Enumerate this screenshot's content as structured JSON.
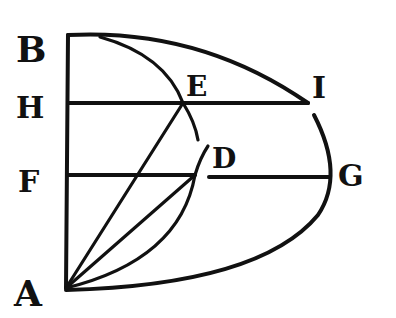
{
  "figure": {
    "type": "geometric-diagram",
    "background": "#ffffff",
    "ink": "#111111",
    "labels": [
      {
        "id": "B",
        "text": "B",
        "x": 16,
        "y": 62,
        "size": 36
      },
      {
        "id": "H",
        "text": "H",
        "x": 16,
        "y": 118,
        "size": 30
      },
      {
        "id": "F",
        "text": "F",
        "x": 18,
        "y": 192,
        "size": 30
      },
      {
        "id": "A",
        "text": "A",
        "x": 14,
        "y": 306,
        "size": 36
      },
      {
        "id": "E",
        "text": "E",
        "x": 186,
        "y": 96,
        "size": 28
      },
      {
        "id": "I",
        "text": "I",
        "x": 312,
        "y": 98,
        "size": 30
      },
      {
        "id": "D",
        "text": "D",
        "x": 212,
        "y": 168,
        "size": 28
      },
      {
        "id": "G",
        "text": "G",
        "x": 338,
        "y": 186,
        "size": 30
      }
    ],
    "points": {
      "A": [
        66,
        288
      ],
      "B": [
        68,
        35
      ],
      "H": [
        68,
        103
      ],
      "F": [
        68,
        175
      ],
      "E": [
        183,
        103
      ],
      "I": [
        308,
        103
      ],
      "D": [
        195,
        175
      ],
      "G": [
        332,
        175
      ]
    }
  }
}
